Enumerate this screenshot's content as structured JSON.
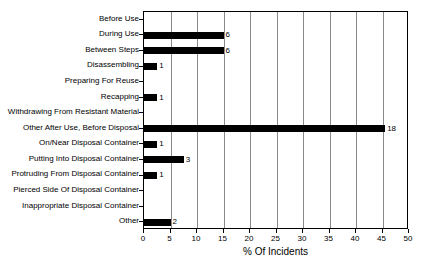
{
  "chart_data": {
    "type": "bar",
    "orientation": "horizontal",
    "title": "",
    "xlabel": "% Of Incidents",
    "ylabel": "",
    "xlim": [
      0,
      50
    ],
    "xticks": [
      0,
      5,
      10,
      15,
      20,
      25,
      30,
      35,
      40,
      45,
      50
    ],
    "grid": "vertical",
    "legend": "none",
    "bar_color": "#000000",
    "categories": [
      "Before Use",
      "During Use",
      "Between Steps",
      "Disassembling",
      "Preparing For Reuse",
      "Recapping",
      "Withdrawing From Resistant Material",
      "Other After Use, Before Disposal",
      "On/Near Disposal Container",
      "Putting Into Disposal Container",
      "Protruding From Disposal Container",
      "Pierced Side Of Disposal Container",
      "Inappropriate Disposal Container",
      "Other"
    ],
    "values": [
      0,
      15,
      15,
      2.5,
      0,
      2.5,
      0,
      45.5,
      2.5,
      7.5,
      2.5,
      0,
      0,
      5
    ],
    "data_labels": [
      "",
      "6",
      "6",
      "1",
      "",
      "1",
      "",
      "18",
      "1",
      "3",
      "1",
      "",
      "",
      "2"
    ]
  }
}
